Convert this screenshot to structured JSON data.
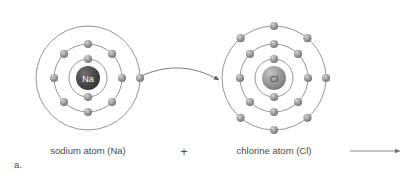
{
  "figure": {
    "panel_label": "a.",
    "width": 410,
    "height": 177,
    "background_color": "#ffffff",
    "ring_color": "#8a8a8a",
    "electron_color": "#9a9a9a",
    "arrow_color": "#7d7d7d"
  },
  "atoms": {
    "sodium": {
      "symbol": "Na",
      "caption": "sodium atom (Na)",
      "nucleus_color": "#4d4d4d",
      "nucleus_label_color": "#ffffff",
      "center_x": 88,
      "center_y": 78,
      "nucleus_radius": 12,
      "shells": [
        {
          "name": "K",
          "radius": 19,
          "electron_count": 2,
          "angles": [
            270,
            90
          ]
        },
        {
          "name": "L",
          "radius": 34,
          "electron_count": 8,
          "angles": [
            0,
            45,
            90,
            135,
            180,
            225,
            270,
            315
          ]
        },
        {
          "name": "M",
          "radius": 52,
          "electron_count": 1,
          "angles": [
            0
          ]
        }
      ]
    },
    "chlorine": {
      "symbol": "Cl",
      "caption": "chlorine atom (Cl)",
      "nucleus_color": "#919191",
      "nucleus_label_color": "#4a4a4a",
      "center_x": 274,
      "center_y": 78,
      "nucleus_radius": 12,
      "shells": [
        {
          "name": "K",
          "radius": 19,
          "electron_count": 2,
          "angles": [
            270,
            90
          ]
        },
        {
          "name": "L",
          "radius": 34,
          "electron_count": 8,
          "angles": [
            0,
            45,
            90,
            135,
            180,
            225,
            270,
            315
          ]
        },
        {
          "name": "M",
          "radius": 52,
          "electron_count": 7,
          "angles": [
            0,
            50,
            90,
            130,
            230,
            270,
            310
          ]
        }
      ]
    }
  },
  "operators": {
    "plus": "+"
  },
  "transfer_arrow": {
    "name": "electron-transfer-arrow",
    "start_x": 141,
    "start_y": 76,
    "control_x": 181,
    "control_y": 58,
    "end_x": 219,
    "end_y": 80
  },
  "reaction_arrow": {
    "name": "reaction-arrow",
    "start_x": 350,
    "start_y": 151,
    "end_x": 400,
    "end_y": 151
  }
}
